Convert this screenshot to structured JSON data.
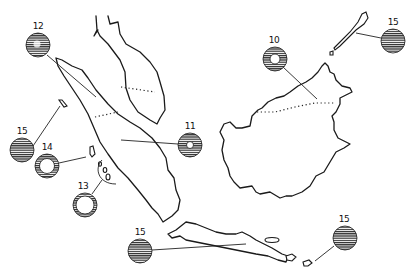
{
  "map": {
    "title": "",
    "regions": [
      "Malay Peninsula",
      "Sumatra",
      "Borneo",
      "Java",
      "Bali",
      "Lombok",
      "Sumbawa",
      "Palawan",
      "Nias",
      "Mentawai Islands",
      "Simeulue"
    ],
    "symbol_style": {
      "hatch_color": "#2a2a2a",
      "background": "#ffffff",
      "line_color": "#1a1a1a"
    },
    "markers": [
      {
        "id": "m12",
        "label": "12",
        "type": "hatched-circle-with-spot",
        "x": 38,
        "y": 45,
        "r": 12,
        "target": "North Sumatra"
      },
      {
        "id": "m15a",
        "label": "15",
        "type": "solid-hatched-circle",
        "x": 22,
        "y": 150,
        "r": 12,
        "target": "Simeulue island"
      },
      {
        "id": "m14",
        "label": "14",
        "type": "hatched-ring",
        "x": 47,
        "y": 165,
        "r": 12,
        "target": "Nias island"
      },
      {
        "id": "m13",
        "label": "13",
        "type": "hatched-ring",
        "x": 85,
        "y": 205,
        "r": 12,
        "target": "Mentawai islands"
      },
      {
        "id": "m11",
        "label": "11",
        "type": "hatched-ring-small-hole",
        "x": 190,
        "y": 144,
        "r": 12,
        "target": "South Sumatra"
      },
      {
        "id": "m10",
        "label": "10",
        "type": "hatched-ring",
        "x": 275,
        "y": 58,
        "r": 12,
        "target": "Sarawak / North Borneo"
      },
      {
        "id": "m15b",
        "label": "15",
        "type": "solid-hatched-circle",
        "x": 393,
        "y": 40,
        "r": 12,
        "target": "Palawan"
      },
      {
        "id": "m15c",
        "label": "15",
        "type": "solid-hatched-circle",
        "x": 140,
        "y": 250,
        "r": 12,
        "target": "Java"
      },
      {
        "id": "m15d",
        "label": "15",
        "type": "solid-hatched-circle",
        "x": 345,
        "y": 238,
        "r": 12,
        "target": "Sumbawa"
      }
    ]
  }
}
